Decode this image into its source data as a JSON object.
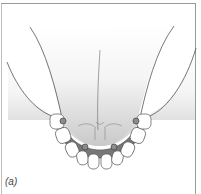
{
  "figure": {
    "label": "(a)",
    "implant_count": 4,
    "tooth_count": 10,
    "colors": {
      "outline": "#555555",
      "gradient_top": "#ffffff",
      "gradient_bottom": "#cfcfcf",
      "bar": "#7a7a7a",
      "implant": "#8c8c8c",
      "tooth": "#ffffff",
      "frame": "#9a9a9a"
    }
  }
}
